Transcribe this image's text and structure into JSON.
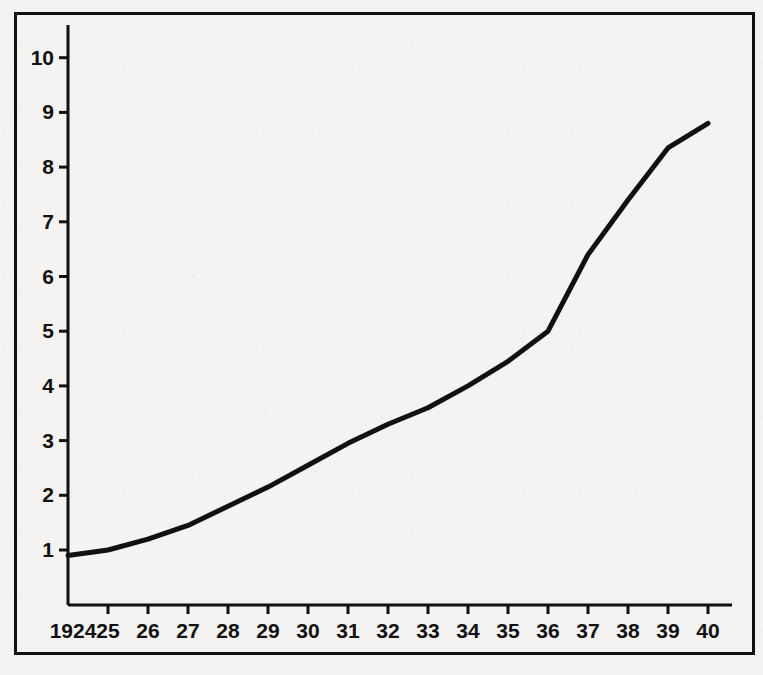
{
  "chart_data": {
    "type": "line",
    "title": "",
    "subtitle": "",
    "xlabel": "",
    "ylabel": "",
    "x": [
      1924,
      1925,
      1926,
      1927,
      1928,
      1929,
      1930,
      1931,
      1932,
      1933,
      1934,
      1935,
      1936,
      1937,
      1938,
      1939,
      1940
    ],
    "xtick_labels": [
      "1924",
      "25",
      "26",
      "27",
      "28",
      "29",
      "30",
      "31",
      "32",
      "33",
      "34",
      "35",
      "36",
      "37",
      "38",
      "39",
      "40"
    ],
    "values": [
      0.9,
      1.0,
      1.2,
      1.45,
      1.8,
      2.15,
      2.55,
      2.95,
      3.3,
      3.6,
      4.0,
      4.45,
      5.0,
      6.4,
      7.4,
      8.35,
      8.8
    ],
    "ytick_labels": [
      "1",
      "2",
      "3",
      "4",
      "5",
      "6",
      "7",
      "8",
      "9",
      "10"
    ],
    "yticks": [
      1,
      2,
      3,
      4,
      5,
      6,
      7,
      8,
      9,
      10
    ],
    "xlim": [
      1924,
      1940
    ],
    "ylim": [
      0,
      10.6
    ],
    "grid": false,
    "legend": null,
    "legend_position": "none",
    "series": [
      {
        "name": "series-1",
        "values": [
          0.9,
          1.0,
          1.2,
          1.45,
          1.8,
          2.15,
          2.55,
          2.95,
          3.3,
          3.6,
          4.0,
          4.45,
          5.0,
          6.4,
          7.4,
          8.35,
          8.8
        ],
        "color": "#111111",
        "line_width": 5
      }
    ],
    "annotations": []
  },
  "figure": {
    "background_color": "#f4f3f1",
    "frame_color": "#111111",
    "axis_color": "#111111",
    "line_color": "#111111"
  },
  "geometry": {
    "frame": {
      "x": 14,
      "y": 12,
      "width": 741,
      "height": 643
    },
    "plot": {
      "left": 68,
      "right": 708,
      "top": 40,
      "bottom": 605
    },
    "x_step_px": 40,
    "y_unit_px": 54.7,
    "y_value1_px": 550,
    "axis_end_x": 732,
    "tick_length": 9
  }
}
